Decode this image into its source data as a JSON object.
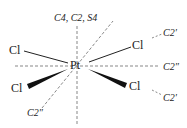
{
  "diagram": {
    "central_atom": "Pt",
    "ligands": [
      {
        "label": "Cl",
        "position": "upper-left",
        "bond": "plain"
      },
      {
        "label": "Cl",
        "position": "upper-right",
        "bond": "plain"
      },
      {
        "label": "Cl",
        "position": "lower-left",
        "bond": "wedge"
      },
      {
        "label": "Cl",
        "position": "lower-right",
        "bond": "wedge"
      }
    ],
    "axes": {
      "principal": "C4, C2, S4",
      "c2_prime_right_upper": "C2′",
      "c2_double_prime_right": "C2″",
      "c2_prime_right_lower": "C2′",
      "c2_double_prime_lower_left": "C2″"
    },
    "colors": {
      "line": "#222222",
      "dashed": "#555555",
      "background": "#ffffff"
    }
  }
}
